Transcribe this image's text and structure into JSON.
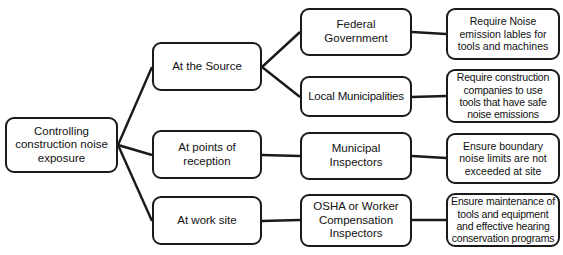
{
  "diagram": {
    "type": "flowchart",
    "orientation": "left-to-right",
    "background_color": "#ffffff",
    "node_border_color": "#1a1a1a",
    "node_fill_color": "#ffffff",
    "text_color": "#111111",
    "edge_color": "#1a1a1a"
  },
  "nodes": {
    "root": {
      "label": "Controlling\nconstruction noise\nexposure",
      "x": 5,
      "y": 117,
      "w": 113,
      "h": 56
    },
    "at_the_source": {
      "label": "At the Source",
      "x": 152,
      "y": 42,
      "w": 110,
      "h": 49
    },
    "at_points_of_reception": {
      "label": "At points of\nreception",
      "x": 152,
      "y": 130,
      "w": 110,
      "h": 49
    },
    "at_work_site": {
      "label": "At work site",
      "x": 152,
      "y": 196,
      "w": 110,
      "h": 49
    },
    "federal_government": {
      "label": "Federal\nGovernment",
      "x": 300,
      "y": 8,
      "w": 112,
      "h": 48
    },
    "local_municipalities": {
      "label": "Local Municipalities",
      "x": 300,
      "y": 76,
      "w": 112,
      "h": 41
    },
    "municipal_inspectors": {
      "label": "Municipal\nInspectors",
      "x": 300,
      "y": 132,
      "w": 112,
      "h": 48
    },
    "osha_inspectors": {
      "label": "OSHA or Worker\nCompensation\nInspectors",
      "x": 300,
      "y": 194,
      "w": 112,
      "h": 53
    },
    "require_noise_labels": {
      "label": "Require Noise\nemission lables for\ntools and machines",
      "x": 446,
      "y": 8,
      "w": 114,
      "h": 52
    },
    "require_construction_companies": {
      "label": "Require construction\ncompanies to use\ntools that have safe\nnoise emissions",
      "x": 446,
      "y": 69,
      "w": 114,
      "h": 54
    },
    "ensure_boundary_limits": {
      "label": "Ensure boundary\nnoise limits are not\nexceeded at site",
      "x": 446,
      "y": 133,
      "w": 114,
      "h": 51
    },
    "ensure_maintenance": {
      "label": "Ensure maintenance of\ntools and equipment\nand effective hearing\nconservation programs",
      "x": 446,
      "y": 193,
      "w": 114,
      "h": 54
    }
  },
  "edges": [
    {
      "name": "root-to-at-the-source",
      "from": "root",
      "to": "at_the_source",
      "points": "118,145 152,67"
    },
    {
      "name": "root-to-at-points-of-reception",
      "from": "root",
      "to": "at_points_of_reception",
      "points": "118,145 152,155"
    },
    {
      "name": "root-to-at-work-site",
      "from": "root",
      "to": "at_work_site",
      "points": "118,145 152,221"
    },
    {
      "name": "source-to-federal-government",
      "from": "at_the_source",
      "to": "federal_government",
      "points": "262,67 300,32"
    },
    {
      "name": "source-to-local-municipalities",
      "from": "at_the_source",
      "to": "local_municipalities",
      "points": "262,67 300,97"
    },
    {
      "name": "reception-to-municipal-inspectors",
      "from": "at_points_of_reception",
      "to": "municipal_inspectors",
      "points": "262,155 300,156"
    },
    {
      "name": "worksite-to-osha-inspectors",
      "from": "at_work_site",
      "to": "osha_inspectors",
      "points": "262,221 300,220"
    },
    {
      "name": "federal-to-require-noise-labels",
      "from": "federal_government",
      "to": "require_noise_labels",
      "points": "412,32 446,34"
    },
    {
      "name": "local-to-require-construction",
      "from": "local_municipalities",
      "to": "require_construction_companies",
      "points": "412,97 446,96"
    },
    {
      "name": "municipal-to-ensure-boundary",
      "from": "municipal_inspectors",
      "to": "ensure_boundary_limits",
      "points": "412,156 446,158"
    },
    {
      "name": "osha-to-ensure-maintenance",
      "from": "osha_inspectors",
      "to": "ensure_maintenance",
      "points": "412,220 446,220"
    }
  ]
}
